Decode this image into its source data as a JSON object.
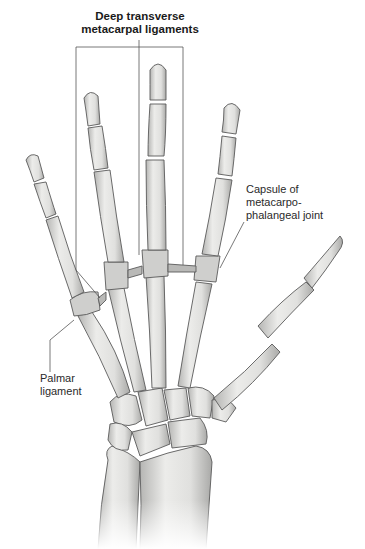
{
  "figure": {
    "labels": {
      "deep_transverse": {
        "line1": "Deep transverse",
        "line2": "metacarpal ligaments"
      },
      "capsule": {
        "line1": "Capsule of",
        "line2": "metacarpo-",
        "line3": "phalangeal joint"
      },
      "palmar": {
        "line1": "Palmar",
        "line2": "ligament"
      }
    },
    "colors": {
      "bone_fill": "#e4e4e2",
      "bone_shade": "#b9b9b7",
      "bone_outline": "#5a5a5a",
      "ligament": "#a8a8a6",
      "leader_line": "#555555",
      "background": "#ffffff"
    }
  }
}
